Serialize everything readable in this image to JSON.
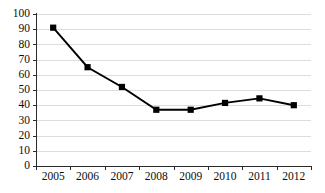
{
  "chart_data": {
    "type": "line",
    "title": "",
    "subtitle": "",
    "xlabel": "",
    "ylabel": "",
    "categories": [
      "2005",
      "2006",
      "2007",
      "2008",
      "2009",
      "2010",
      "2011",
      "2012"
    ],
    "values": [
      91,
      65,
      52,
      37,
      37,
      41.5,
      44.5,
      40
    ],
    "series": [
      {
        "name": "",
        "values": [
          91,
          65,
          52,
          37,
          37,
          41.5,
          44.5,
          40
        ],
        "marker": "square",
        "marker_color": "#000000",
        "line_color": "#000000"
      }
    ],
    "ylim": [
      0,
      100
    ],
    "ytick_values": [
      0,
      10,
      20,
      30,
      40,
      50,
      60,
      70,
      80,
      90,
      100
    ],
    "ytick_labels": [
      "0",
      "10",
      "20",
      "30",
      "40",
      "50",
      "60",
      "70",
      "80",
      "90",
      "100"
    ],
    "xtick_labels": [
      "2005",
      "2006",
      "2007",
      "2008",
      "2009",
      "2010",
      "2011",
      "2012"
    ],
    "grid": true,
    "grid_axis": "y",
    "grid_color": "#d9d9d9",
    "legend": false,
    "legend_position": "none",
    "annotations": [],
    "background_color": "#ffffff",
    "axis_color": "#2b2b2b"
  },
  "layout": {
    "plot_left": 36,
    "plot_right": 311,
    "plot_top": 14,
    "plot_bottom": 166,
    "width": 325,
    "height": 193
  }
}
